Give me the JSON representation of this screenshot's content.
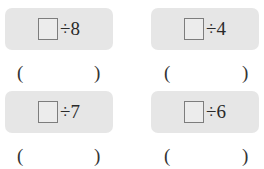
{
  "problems": [
    {
      "operator": "÷",
      "divisor": "8",
      "expression": "÷8",
      "answer_open": "(",
      "answer_close": ")"
    },
    {
      "operator": "÷",
      "divisor": "4",
      "expression": "÷4",
      "answer_open": "(",
      "answer_close": ")"
    },
    {
      "operator": "÷",
      "divisor": "7",
      "expression": "÷7",
      "answer_open": "(",
      "answer_close": ")"
    },
    {
      "operator": "÷",
      "divisor": "6",
      "expression": "÷6",
      "answer_open": "(",
      "answer_close": ")"
    }
  ],
  "colors": {
    "box_background": "#e6e6e6",
    "square_border": "#7d7d7d",
    "text": "#2a2a2a"
  }
}
